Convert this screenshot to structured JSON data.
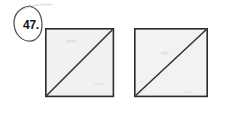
{
  "figure": {
    "kind": "geometry-worksheet-figure",
    "background_color": "#ffffff",
    "problem_label": {
      "text": "47.",
      "circled": true,
      "circle_style": "hand-drawn-ellipse",
      "ink_color": "#141414"
    },
    "shapes": [
      {
        "name": "square-left",
        "type": "square",
        "x": 45,
        "y": 28,
        "size": 69,
        "fill_color": "#f1f1f1",
        "stroke_color": "#2b2b2b",
        "stroke_width": 1.6,
        "diagonal": {
          "present": true,
          "from": "bottom-left",
          "to": "top-right",
          "stroke_color": "#2b2b2b",
          "stroke_width": 1.4
        },
        "smudges": [
          {
            "cx": 71,
            "cy": 41,
            "rx": 5,
            "ry": 1.6,
            "opacity": 0.1
          },
          {
            "cx": 99,
            "cy": 84,
            "rx": 5,
            "ry": 1.6,
            "opacity": 0.08
          }
        ]
      },
      {
        "name": "square-right",
        "type": "square",
        "x": 134,
        "y": 28,
        "size": 74,
        "fill_color": "#f2f2f2",
        "stroke_color": "#2b2b2b",
        "stroke_width": 1.6,
        "diagonal": {
          "present": true,
          "from": "bottom-left",
          "to": "top-right",
          "stroke_color": "#2b2b2b",
          "stroke_width": 1.4
        },
        "smudges": [
          {
            "cx": 165,
            "cy": 53,
            "rx": 4,
            "ry": 1.5,
            "opacity": 0.1
          },
          {
            "cx": 188,
            "cy": 92,
            "rx": 5,
            "ry": 1.5,
            "opacity": 0.07
          }
        ]
      }
    ],
    "stray_marks": [
      {
        "name": "top-scan-artifact",
        "x1": 22,
        "y1": 9,
        "x2": 52,
        "y2": 5,
        "opacity": 0.22
      }
    ]
  }
}
